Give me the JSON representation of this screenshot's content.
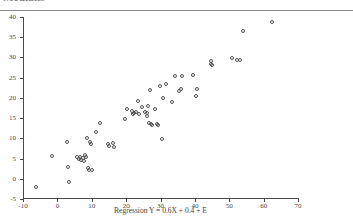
{
  "header": {
    "clipped_heading": "Medians"
  },
  "chart_data": {
    "type": "scatter",
    "title": "",
    "xlabel": "Regression Y = 0.6X + 0.4 + E",
    "ylabel": "",
    "xlim": [
      -10,
      70
    ],
    "ylim": [
      -5,
      40
    ],
    "xticks": [
      -10,
      0,
      10,
      20,
      30,
      40,
      50,
      60,
      70
    ],
    "yticks": [
      -5,
      0,
      5,
      10,
      15,
      20,
      25,
      30,
      35,
      40
    ],
    "grid": false,
    "legend": false,
    "marker": "open-circle",
    "marker_color": "#515151",
    "axis_color": "#4a4a4a",
    "series": [
      {
        "name": "observations",
        "points": [
          [
            -6.1,
            -2.0
          ],
          [
            -1.6,
            5.7
          ],
          [
            2.9,
            9.0
          ],
          [
            3.2,
            2.9
          ],
          [
            3.3,
            -0.7
          ],
          [
            5.8,
            5.3
          ],
          [
            6.2,
            4.9
          ],
          [
            6.6,
            5.4
          ],
          [
            6.9,
            4.6
          ],
          [
            7.4,
            5.1
          ],
          [
            7.6,
            4.4
          ],
          [
            8.1,
            5.8
          ],
          [
            8.3,
            5.4
          ],
          [
            8.6,
            10.0
          ],
          [
            8.8,
            2.6
          ],
          [
            9.1,
            2.2
          ],
          [
            9.4,
            9.1
          ],
          [
            9.7,
            8.7
          ],
          [
            10.1,
            2.2
          ],
          [
            11.2,
            11.6
          ],
          [
            12.3,
            13.8
          ],
          [
            14.6,
            8.6
          ],
          [
            15.0,
            8.1
          ],
          [
            16.2,
            8.8
          ],
          [
            16.6,
            7.8
          ],
          [
            19.8,
            14.8
          ],
          [
            20.3,
            17.2
          ],
          [
            21.6,
            16.7
          ],
          [
            22.1,
            15.9
          ],
          [
            22.4,
            16.3
          ],
          [
            23.0,
            16.6
          ],
          [
            23.4,
            19.3
          ],
          [
            24.6,
            17.7
          ],
          [
            25.6,
            16.6
          ],
          [
            26.0,
            16.2
          ],
          [
            26.2,
            15.6
          ],
          [
            26.4,
            18.0
          ],
          [
            26.6,
            13.9
          ],
          [
            27.0,
            22.0
          ],
          [
            27.3,
            13.5
          ],
          [
            27.6,
            13.4
          ],
          [
            28.3,
            17.3
          ],
          [
            29.0,
            13.6
          ],
          [
            29.4,
            13.4
          ],
          [
            29.8,
            22.9
          ],
          [
            30.4,
            9.9
          ],
          [
            30.7,
            20.0
          ],
          [
            31.5,
            23.4
          ],
          [
            33.4,
            18.9
          ],
          [
            34.2,
            25.4
          ],
          [
            35.4,
            21.7
          ],
          [
            36.0,
            22.2
          ],
          [
            39.4,
            25.6
          ],
          [
            40.3,
            20.4
          ],
          [
            40.6,
            22.3
          ],
          [
            44.6,
            28.4
          ],
          [
            44.7,
            29.2
          ],
          [
            45.0,
            28.2
          ],
          [
            50.9,
            29.8
          ],
          [
            52.2,
            29.3
          ],
          [
            53.1,
            29.3
          ],
          [
            53.9,
            36.6
          ],
          [
            62.3,
            38.7
          ],
          [
            36.3,
            25.3
          ],
          [
            23.8,
            16.0
          ]
        ]
      }
    ]
  }
}
